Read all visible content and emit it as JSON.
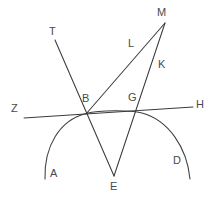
{
  "figure": {
    "type": "geometry-diagram",
    "background_color": "#ffffff",
    "stroke_color": "#3b3b3b",
    "label_color": "#4a4a4a"
  },
  "labels": {
    "T": "T",
    "M": "M",
    "L": "L",
    "K": "K",
    "B": "B",
    "G": "G",
    "Z": "Z",
    "H": "H",
    "A": "A",
    "D": "D",
    "E": "E"
  },
  "points": {
    "T": {
      "x": 55,
      "y": 40,
      "label_x": 49,
      "label_y": 26
    },
    "M": {
      "x": 165,
      "y": 23,
      "label_x": 157,
      "label_y": 7
    },
    "L": {
      "x": 132,
      "y": 67,
      "label_x": 128,
      "label_y": 38
    },
    "K": {
      "x": 155,
      "y": 62,
      "label_x": 158,
      "label_y": 59
    },
    "B": {
      "x": 86,
      "y": 114,
      "label_x": 82,
      "label_y": 93
    },
    "G": {
      "x": 142,
      "y": 113,
      "label_x": 128,
      "label_y": 92
    },
    "Z": {
      "x": 24,
      "y": 118,
      "label_x": 11,
      "label_y": 103
    },
    "H": {
      "x": 193,
      "y": 107,
      "label_x": 196,
      "label_y": 99
    },
    "A": {
      "x": 45,
      "y": 179,
      "label_x": 50,
      "label_y": 168
    },
    "D": {
      "x": 190,
      "y": 179,
      "label_x": 173,
      "label_y": 155
    },
    "E": {
      "x": 114,
      "y": 176,
      "label_x": 110,
      "label_y": 181
    }
  },
  "segments": [
    {
      "name": "line-Z-H",
      "from": "Z",
      "to": "H"
    },
    {
      "name": "line-T-E",
      "from": "T",
      "to": "E"
    },
    {
      "name": "line-B-M",
      "from": "B",
      "to": "M"
    },
    {
      "name": "line-E-M",
      "from": "E",
      "to": "M"
    }
  ],
  "arcs": [
    {
      "name": "arc-A-D",
      "from": "A",
      "through": "B,G",
      "to": "D"
    }
  ]
}
